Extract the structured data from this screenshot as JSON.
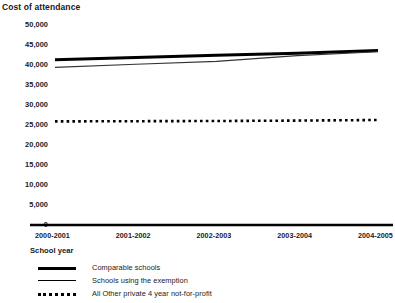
{
  "chart_data": {
    "type": "line",
    "title": "Cost of attendance",
    "xlabel": "School year",
    "ylabel": "",
    "categories": [
      "2000-2001",
      "2001-2002",
      "2002-2003",
      "2003-2004",
      "2004-2005"
    ],
    "ylim": [
      0,
      50000
    ],
    "yticks": [
      "0",
      "5,000",
      "10,000",
      "15,000",
      "20,000",
      "25,000",
      "30,000",
      "35,000",
      "40,000",
      "45,000",
      "50,000"
    ],
    "ytick_values": [
      0,
      5000,
      10000,
      15000,
      20000,
      25000,
      30000,
      35000,
      40000,
      45000,
      50000
    ],
    "grid": false,
    "legend_position": "below",
    "series": [
      {
        "name": "Comparable schools",
        "style": "thick-solid",
        "color": "#000000",
        "values": [
          41300,
          41900,
          42450,
          42950,
          43600
        ]
      },
      {
        "name": "Schools using the exemption",
        "style": "thin-solid",
        "color": "#333333",
        "values": [
          39400,
          40200,
          40900,
          42350,
          43300
        ]
      },
      {
        "name": "All Other private 4 year not-for-profit",
        "style": "dotted",
        "color": "#000000",
        "values": [
          25900,
          25950,
          26000,
          26100,
          26250
        ]
      }
    ]
  },
  "legend": {
    "items": [
      {
        "label": "Comparable schools",
        "marker": "thick-line-marker"
      },
      {
        "label": "Schools using the exemption",
        "marker": "thin-line-marker"
      },
      {
        "label": "All Other private 4 year not-for-profit",
        "marker": "dotted-line-marker"
      }
    ]
  }
}
